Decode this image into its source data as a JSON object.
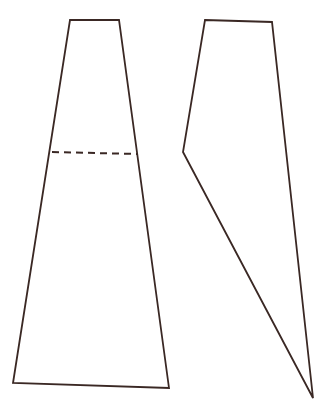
{
  "page": {
    "background_color": "#ffffff",
    "width": 333,
    "height": 410
  },
  "style": {
    "stroke_color": "#3a2824",
    "fill_color": "#ffffff",
    "stroke_width": 1.8,
    "dash_stroke_width": 2.0,
    "dash_pattern": "7,5"
  },
  "figures": [
    {
      "id": "left-figure",
      "name": "tapered-trapezoid-panel",
      "type": "polygon",
      "description": "Narrow-topped trapezoid panel with a horizontal dashed fold line across the upper third",
      "points": "70,20 119,20 169,388 13,383",
      "vertices": [
        {
          "label": "top-left",
          "x": 70,
          "y": 20
        },
        {
          "label": "top-right",
          "x": 119,
          "y": 20
        },
        {
          "label": "bottom-right",
          "x": 169,
          "y": 388
        },
        {
          "label": "bottom-left",
          "x": 13,
          "y": 383
        }
      ],
      "fold_line": {
        "name": "dashed-fold-line",
        "x1": 52,
        "y1": 152,
        "x2": 137,
        "y2": 154
      }
    },
    {
      "id": "right-figure",
      "name": "notched-tapered-panel",
      "type": "polygon",
      "description": "Tapered panel narrowing to a point at lower right with a concave notch vertex on the left edge",
      "points": "205,20 272,22 313,398 183,152",
      "vertices": [
        {
          "label": "top-left",
          "x": 205,
          "y": 20
        },
        {
          "label": "top-right",
          "x": 272,
          "y": 22
        },
        {
          "label": "bottom-point",
          "x": 313,
          "y": 398
        },
        {
          "label": "left-notch",
          "x": 183,
          "y": 152
        }
      ]
    }
  ]
}
